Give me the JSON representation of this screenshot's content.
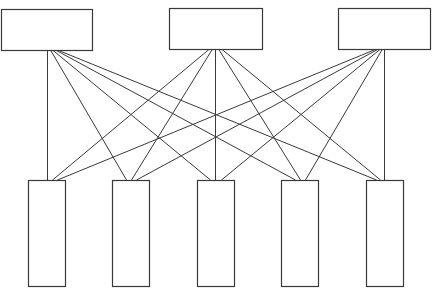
{
  "diagram": {
    "type": "bipartite-network",
    "stroke_color": "#3a3a3a",
    "fill_color": "#ffffff",
    "top_nodes": [
      {
        "id": "T1",
        "x": 1.5,
        "y": 9.5,
        "w": 91,
        "h": 41
      },
      {
        "id": "T2",
        "x": 169.5,
        "y": 8.5,
        "w": 93,
        "h": 41
      },
      {
        "id": "T3",
        "x": 338.5,
        "y": 8.5,
        "w": 92,
        "h": 41
      }
    ],
    "bottom_nodes": [
      {
        "id": "B1",
        "x": 28.5,
        "y": 180.5,
        "w": 37,
        "h": 106
      },
      {
        "id": "B2",
        "x": 112.5,
        "y": 180.5,
        "w": 37,
        "h": 106
      },
      {
        "id": "B3",
        "x": 197.5,
        "y": 180.5,
        "w": 37,
        "h": 106
      },
      {
        "id": "B4",
        "x": 281.5,
        "y": 180.5,
        "w": 37,
        "h": 106
      },
      {
        "id": "B5",
        "x": 366.5,
        "y": 180.5,
        "w": 37,
        "h": 106
      }
    ],
    "edges": [
      {
        "from": "T1",
        "to": "B1",
        "x1": 47,
        "y1": 50,
        "x2": 47,
        "y2": 180
      },
      {
        "from": "T1",
        "to": "B2",
        "x1": 50,
        "y1": 50,
        "x2": 126,
        "y2": 180
      },
      {
        "from": "T1",
        "to": "B3",
        "x1": 52,
        "y1": 50,
        "x2": 210,
        "y2": 180
      },
      {
        "from": "T1",
        "to": "B4",
        "x1": 55,
        "y1": 50,
        "x2": 295,
        "y2": 180
      },
      {
        "from": "T1",
        "to": "B5",
        "x1": 57,
        "y1": 50,
        "x2": 376,
        "y2": 180
      },
      {
        "from": "T2",
        "to": "B1",
        "x1": 209,
        "y1": 49,
        "x2": 52,
        "y2": 180
      },
      {
        "from": "T2",
        "to": "B2",
        "x1": 212,
        "y1": 49,
        "x2": 131,
        "y2": 180
      },
      {
        "from": "T2",
        "to": "B3",
        "x1": 215,
        "y1": 49,
        "x2": 215,
        "y2": 180
      },
      {
        "from": "T2",
        "to": "B4",
        "x1": 218,
        "y1": 49,
        "x2": 300,
        "y2": 180
      },
      {
        "from": "T2",
        "to": "B5",
        "x1": 221,
        "y1": 49,
        "x2": 380,
        "y2": 180
      },
      {
        "from": "T3",
        "to": "B1",
        "x1": 376,
        "y1": 49,
        "x2": 57,
        "y2": 180
      },
      {
        "from": "T3",
        "to": "B2",
        "x1": 378,
        "y1": 49,
        "x2": 136,
        "y2": 180
      },
      {
        "from": "T3",
        "to": "B3",
        "x1": 380,
        "y1": 49,
        "x2": 221,
        "y2": 180
      },
      {
        "from": "T3",
        "to": "B4",
        "x1": 382,
        "y1": 49,
        "x2": 305,
        "y2": 180
      },
      {
        "from": "T3",
        "to": "B5",
        "x1": 384,
        "y1": 49,
        "x2": 384,
        "y2": 180
      }
    ]
  }
}
